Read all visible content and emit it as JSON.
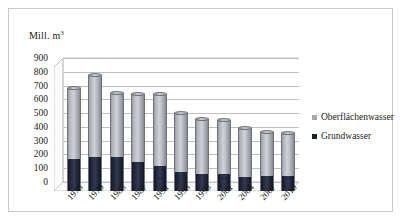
{
  "chart_data": {
    "type": "bar",
    "title": "",
    "subtitle": "",
    "stacked": true,
    "xlabel": "",
    "ylabel": "Mill. m³",
    "ylabel_text": "Mill. m",
    "ylabel_sup": "3",
    "ylim": [
      0,
      900
    ],
    "ytick_step": 100,
    "yticks": [
      "900",
      "800",
      "700",
      "600",
      "500",
      "400",
      "300",
      "200",
      "100",
      "0"
    ],
    "grid": true,
    "legend_position": "right",
    "categories": [
      "1975",
      "1979",
      "1983",
      "1987",
      "1991",
      "1995",
      "1998",
      "2001",
      "2004",
      "2007",
      "2010"
    ],
    "series": [
      {
        "name": "Grundwasser",
        "color": "#1b2033",
        "values": [
          235,
          250,
          248,
          210,
          185,
          140,
          120,
          122,
          105,
          108,
          108
        ]
      },
      {
        "name": "Oberflächenwasser",
        "color": "#a6a9ae",
        "values": [
          515,
          590,
          462,
          495,
          520,
          425,
          400,
          393,
          350,
          322,
          312
        ]
      }
    ],
    "totals": [
      750,
      840,
      710,
      705,
      705,
      565,
      520,
      515,
      455,
      430,
      420
    ],
    "annotations": []
  },
  "legend": {
    "items": [
      {
        "label": "Oberflächenwasser",
        "swatch": "light"
      },
      {
        "label": "Grundwasser",
        "swatch": "dark"
      }
    ]
  }
}
